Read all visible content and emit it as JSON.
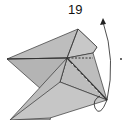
{
  "diagram": {
    "step_number": "19",
    "fill_color": "#bdbdbd",
    "line_color": "#333333",
    "arrow": "valley fold rotate arrow",
    "marker": "dot"
  }
}
